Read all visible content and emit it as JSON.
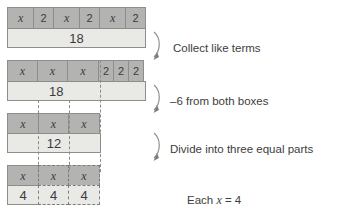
{
  "diagram": {
    "colors": {
      "tile_variable": "#b3b3b1",
      "tile_constant": "#e9e9e6",
      "border": "#8d8d8b",
      "guide_line": "#8a8a88",
      "text": "#3d3d3d"
    },
    "rows": [
      {
        "id": "row-1",
        "name": "original-equation",
        "top_cells": [
          {
            "label": "x",
            "kind": "variable"
          },
          {
            "label": "2",
            "kind": "variable"
          },
          {
            "label": "x",
            "kind": "variable"
          },
          {
            "label": "2",
            "kind": "variable"
          },
          {
            "label": "x",
            "kind": "variable"
          },
          {
            "label": "2",
            "kind": "variable"
          }
        ],
        "bottom_cells": [
          {
            "label": "18",
            "kind": "constant"
          }
        ]
      },
      {
        "id": "row-2",
        "name": "collected-terms",
        "top_cells": [
          {
            "label": "x",
            "kind": "variable"
          },
          {
            "label": "x",
            "kind": "variable"
          },
          {
            "label": "x",
            "kind": "variable"
          },
          {
            "label": "2",
            "kind": "variable"
          },
          {
            "label": "2",
            "kind": "variable"
          },
          {
            "label": "2",
            "kind": "variable"
          }
        ],
        "bottom_cells": [
          {
            "label": "18",
            "kind": "constant"
          }
        ]
      },
      {
        "id": "row-3",
        "name": "after-subtracting-six",
        "top_cells": [
          {
            "label": "x",
            "kind": "variable"
          },
          {
            "label": "x",
            "kind": "variable"
          },
          {
            "label": "x",
            "kind": "variable"
          }
        ],
        "bottom_cells": [
          {
            "label": "12",
            "kind": "constant"
          }
        ]
      },
      {
        "id": "row-4",
        "name": "divided-into-three-parts",
        "top_cells": [
          {
            "label": "x",
            "kind": "variable"
          },
          {
            "label": "x",
            "kind": "variable"
          },
          {
            "label": "x",
            "kind": "variable"
          }
        ],
        "bottom_cells": [
          {
            "label": "4",
            "kind": "constant"
          },
          {
            "label": "4",
            "kind": "constant"
          },
          {
            "label": "4",
            "kind": "constant"
          }
        ]
      }
    ],
    "steps": [
      {
        "id": "step-1",
        "label": "Collect like terms"
      },
      {
        "id": "step-2",
        "label": "–6 from both boxes"
      },
      {
        "id": "step-3",
        "label": "Divide into three equal parts"
      }
    ],
    "conclusion": {
      "prefix": "Each ",
      "variable": "x",
      "suffix": " = 4"
    }
  }
}
